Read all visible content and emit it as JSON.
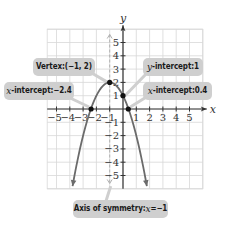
{
  "chart_data": {
    "type": "line",
    "title": "",
    "function": "y = -x^2 - 2x + 1",
    "xlabel": "x",
    "ylabel": "y",
    "xlim": [
      -5.7,
      6
    ],
    "ylim": [
      -6,
      6
    ],
    "grid": true,
    "x_ticks": [
      -5,
      -4,
      -3,
      -2,
      -1,
      1,
      2,
      3,
      4,
      5
    ],
    "y_ticks": [
      -5,
      -4,
      -3,
      -2,
      -1,
      1,
      2,
      3,
      4,
      5
    ],
    "x_tick_labels": [
      "−5",
      "−4",
      "−3",
      "−2",
      "−1",
      "1",
      "2",
      "3",
      "4",
      "5"
    ],
    "y_tick_labels": [
      "5",
      "4",
      "3",
      "2",
      "1",
      "−1",
      "−2",
      "−3",
      "−4",
      "−5"
    ],
    "series": [
      {
        "name": "parabola",
        "color": "#6b6b6b",
        "x": [
          -4.16,
          -4,
          -3,
          -2.4,
          -2,
          -1,
          0,
          0.4,
          1,
          2,
          2.16
        ],
        "y": [
          -8,
          -7,
          -2,
          0.04,
          1,
          2,
          1,
          0.04,
          -2,
          -7,
          -8
        ]
      }
    ],
    "key_points": [
      {
        "label": "Vertex",
        "x": -1,
        "y": 2
      },
      {
        "label": "y-intercept",
        "x": 0,
        "y": 1
      },
      {
        "label": "x-intercept",
        "x": -2.4,
        "y": 0
      },
      {
        "label": "x-intercept",
        "x": 0.4,
        "y": 0
      }
    ],
    "axis_of_symmetry": -1,
    "annotations": [
      "Vertex: (−1, 2)",
      "x-intercept: −2.4",
      "y-intercept: 1",
      "x-intercept: 0.4",
      "Axis of symmetry: x = −1"
    ]
  },
  "axes": {
    "x_name": "x",
    "y_name": "y"
  },
  "callouts": {
    "vertex": {
      "prefix": "Vertex: ",
      "value": "(−1, 2)"
    },
    "x_intercept_left": {
      "var": "x",
      "prefix": "-intercept: ",
      "value": "−2.4"
    },
    "y_intercept": {
      "var": "y",
      "prefix": "-intercept: ",
      "value": "1"
    },
    "x_intercept_right": {
      "var": "x",
      "prefix": "-intercept: ",
      "value": "0.4"
    },
    "axis_of_symmetry": {
      "prefix": "Axis of symmetry: ",
      "var": "x",
      "eq": " = ",
      "value": "−1"
    }
  },
  "colors": {
    "curve": "#6b6b6b",
    "grid": "#d8d8d8",
    "axis": "#333333",
    "symmetry_line": "#b0b0b0",
    "callout_bg": "#cfcfcf",
    "point": "#111111"
  }
}
